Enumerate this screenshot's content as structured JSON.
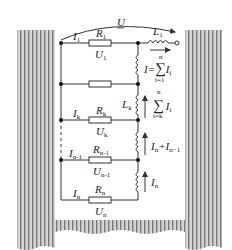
{
  "diagram": {
    "colors": {
      "wire": "#333333",
      "hatch_light": "#cfcfcf",
      "hatch_dark": "#7a7a7a",
      "background": "#ffffff"
    },
    "labels": {
      "U": "U",
      "I1": "I",
      "I1_sub": "1",
      "R1": "R",
      "R1_sub": "1",
      "U1": "U",
      "U1_sub": "1",
      "L1": "L",
      "L1_sub": "1",
      "sum_total": "I=∑I",
      "sum_total_sub": "i",
      "sum_total_top": "n",
      "sum_total_bottom": "i=1",
      "Lk": "L",
      "Lk_sub": "k",
      "sum_k": "∑ I",
      "sum_k_sub": "i",
      "sum_k_top": "n",
      "sum_k_bottom": "i=k",
      "Ik": "I",
      "Ik_sub": "k",
      "Rk": "R",
      "Rk_sub": "k",
      "Uk": "U",
      "Uk_sub": "k",
      "In_plus_In1": "I",
      "In_plus_In1_a_sub": "n",
      "In_plus_In1_plus": "+I",
      "In_plus_In1_b_sub": "n−1",
      "In1": "I",
      "In1_sub": "n-1",
      "Rn1": "R",
      "Rn1_sub": "n-1",
      "Un1": "U",
      "Un1_sub": "n-1",
      "In_arrow": "I",
      "In_arrow_sub": "n",
      "In": "I",
      "In_sub": "n",
      "Rn": "R",
      "Rn_sub": "n",
      "Un": "U",
      "Un_sub": "n"
    }
  }
}
